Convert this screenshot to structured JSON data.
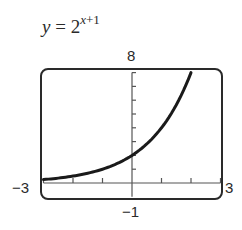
{
  "title": {
    "lhs": "y",
    "equals": "=",
    "base": "2",
    "exponent_var": "x",
    "exponent_rest": "+1"
  },
  "window_labels": {
    "ymax": "8",
    "ymin": "−1",
    "xmin": "−3",
    "xmax": "3"
  },
  "colors": {
    "frame": "#2a2a2a",
    "axis": "#555555",
    "curve": "#1a1a1a"
  },
  "chart_data": {
    "type": "line",
    "xlabel": "",
    "ylabel": "",
    "xlim": [
      -3,
      3
    ],
    "ylim": [
      -1,
      8
    ],
    "x_ticks": [
      -3,
      -2,
      -1,
      0,
      1,
      2,
      3
    ],
    "y_ticks": [
      0,
      1,
      2,
      3,
      4,
      5,
      6,
      7,
      8
    ],
    "grid": false,
    "legend": null,
    "series": [
      {
        "name": "y = 2^(x+1)",
        "x": [
          -3,
          -2.5,
          -2,
          -1.5,
          -1,
          -0.5,
          0,
          0.5,
          1,
          1.5,
          2
        ],
        "values": [
          0.25,
          0.354,
          0.5,
          0.707,
          1,
          1.414,
          2,
          2.828,
          4,
          5.657,
          8
        ]
      }
    ]
  }
}
